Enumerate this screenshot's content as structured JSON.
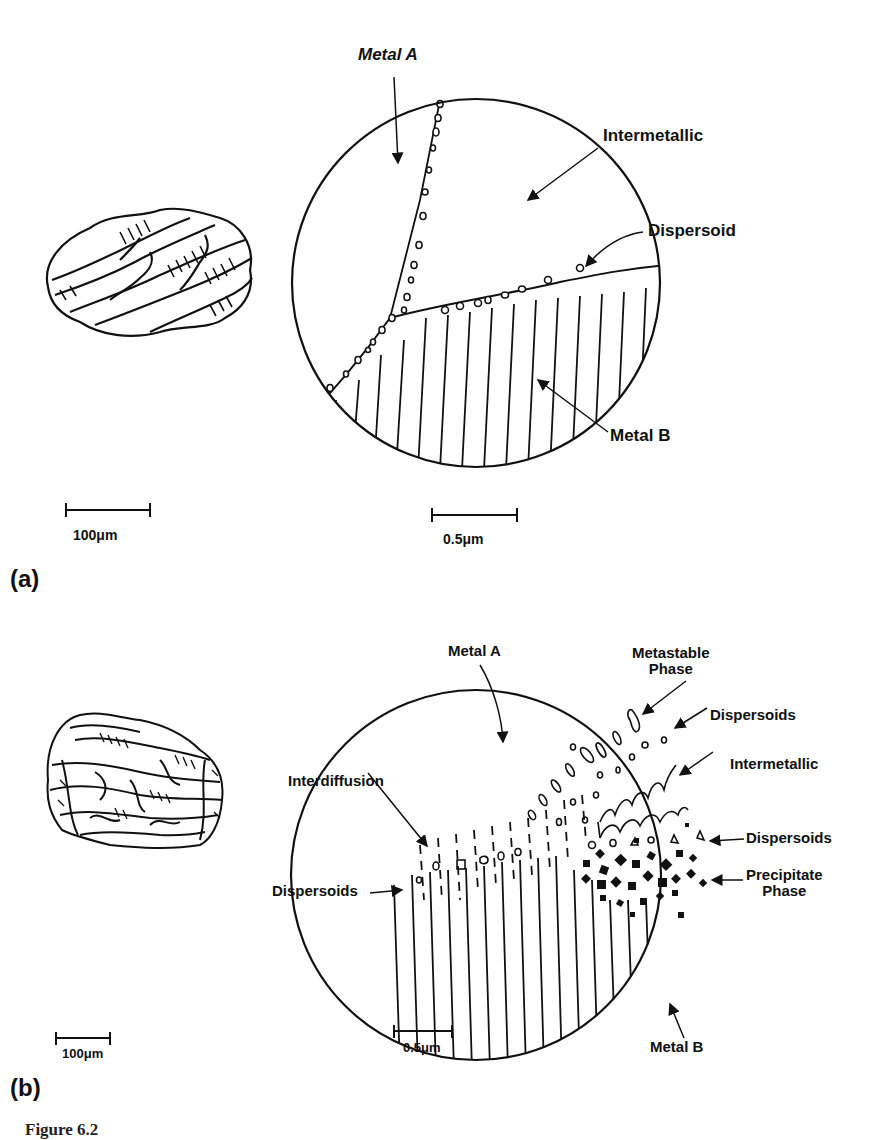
{
  "figure": {
    "caption_prefix": "Figure 6.2"
  },
  "panel_a": {
    "label": "(a)",
    "labels": {
      "metal_a": "Metal A",
      "intermetallic": "Intermetallic",
      "dispersoid": "Dispersoid",
      "metal_b": "Metal B"
    },
    "scale_left": "100μm",
    "scale_right": "0.5μm"
  },
  "panel_b": {
    "label": "(b)",
    "labels": {
      "metal_a": "Metal A",
      "metastable_phase": "Metastable\nPhase",
      "dispersoids_top": "Dispersoids",
      "intermetallic": "Intermetallic",
      "interdiffusion": "Interdiffusion",
      "dispersoids_right": "Dispersoids",
      "precipitate_phase": "Precipitate\nPhase",
      "dispersoids_left": "Dispersoids",
      "metal_b": "Metal B"
    },
    "scale_left": "100μm",
    "scale_right": "0.5μm"
  }
}
